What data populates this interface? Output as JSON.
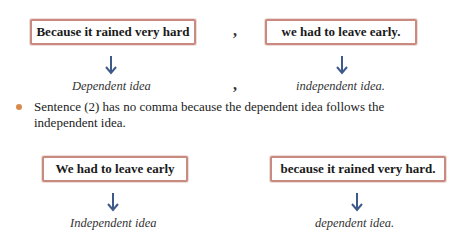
{
  "colors": {
    "box_border": "#c98a80",
    "arrow": "#3e5a8a",
    "bullet": "#d98a4a"
  },
  "example1": {
    "left_box": "Because it rained very hard",
    "separator_comma": ",",
    "right_box": "we had to leave early.",
    "left_label": "Dependent idea",
    "label_comma": ",",
    "right_label": "independent idea."
  },
  "bullet": {
    "icon": "bullet-dot",
    "text": "Sentence (2) has no comma because the dependent idea follows the independent idea."
  },
  "example2": {
    "left_box": "We had to leave early",
    "right_box": "because it rained very hard.",
    "left_label": "Independent idea",
    "right_label": "dependent idea."
  }
}
